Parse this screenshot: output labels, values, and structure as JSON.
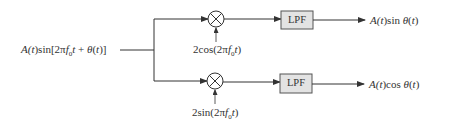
{
  "diagram": {
    "type": "block-diagram",
    "input": {
      "label": "A(t)sin[2πf0t + θ(t)]",
      "parts": {
        "pre": "A(",
        "t1": "t",
        "mid": ")sin[2π",
        "f": "f",
        "sub": "0",
        "t2": "t",
        "plus": " + ",
        "theta": "θ",
        "open": "(",
        "t3": "t",
        "close": ")]"
      }
    },
    "branches": [
      {
        "id": "top",
        "mixer": {
          "symbol": "⊗"
        },
        "oscillator_label": {
          "full": "2cos(2πf0t)",
          "pre": "2cos(2π",
          "f": "f",
          "sub": "0",
          "t": "t",
          "close": ")"
        },
        "filter": {
          "label": "LPF"
        },
        "output": {
          "full": "A(t)sin θ(t)",
          "pre": "A(",
          "t1": "t",
          "mid": ")sin ",
          "theta": "θ",
          "open": "(",
          "t2": "t",
          "close": ")"
        }
      },
      {
        "id": "bottom",
        "mixer": {
          "symbol": "⊗"
        },
        "oscillator_label": {
          "full": "2sin(2πf0t)",
          "pre": "2sin(2π",
          "f": "f",
          "sub": "0",
          "t": "t",
          "close": ")"
        },
        "filter": {
          "label": "LPF"
        },
        "output": {
          "full": "A(t)cos θ(t)",
          "pre": "A(",
          "t1": "t",
          "mid": ")cos ",
          "theta": "θ",
          "open": "(",
          "t2": "t",
          "close": ")"
        }
      }
    ],
    "colors": {
      "line": "#333333",
      "box_fill": "#e3e3e3",
      "box_stroke": "#555555",
      "text": "#333333"
    }
  }
}
